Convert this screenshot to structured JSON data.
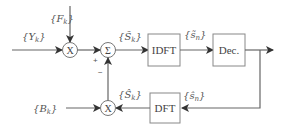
{
  "diagram": {
    "type": "signal-processing block diagram",
    "inputs": {
      "y": {
        "brace_open": "{",
        "symbol": "Y",
        "sub": "k",
        "brace_close": "}"
      },
      "f": {
        "brace_open": "{",
        "symbol": "F",
        "sub": "k",
        "brace_close": "}"
      },
      "b": {
        "brace_open": "{",
        "symbol": "B",
        "sub": "k",
        "brace_close": "}"
      }
    },
    "signals": {
      "s_tilde_k": {
        "brace_open": "{",
        "symbol": "S̃",
        "sub": "k",
        "brace_close": "}"
      },
      "s_tilde_n": {
        "brace_open": "{",
        "symbol": "s̃",
        "sub": "n",
        "brace_close": "}"
      },
      "s_hat_n": {
        "brace_open": "{",
        "symbol": "ŝ",
        "sub": "n",
        "brace_close": "}"
      },
      "s_hat_k": {
        "brace_open": "{",
        "symbol": "Ŝ",
        "sub": "k",
        "brace_close": "}"
      }
    },
    "operators": {
      "mult_top": "X",
      "sum": "Σ",
      "mult_bottom": "X",
      "plus_sign": "+",
      "minus_sign": "−"
    },
    "blocks": {
      "idft": "IDFT",
      "dec": "Dec.",
      "dft": "DFT"
    },
    "colors": {
      "line": "#666666",
      "text": "#444444",
      "background": "#ffffff"
    }
  }
}
